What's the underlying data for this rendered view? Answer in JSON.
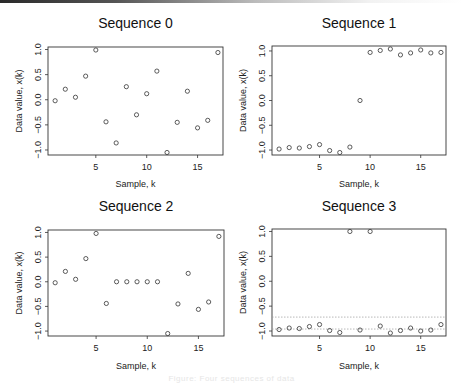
{
  "figure": {
    "caption": "Figure: Four sequences of data"
  },
  "chart_data": [
    {
      "type": "scatter",
      "title": "Sequence 0",
      "xlabel": "Sample, k",
      "ylabel": "Data value, x(k)",
      "xlim": [
        0.3,
        17.5
      ],
      "ylim": [
        -1.1,
        1.05
      ],
      "xticks": [
        5,
        10,
        15
      ],
      "yticks": [
        -1.0,
        -0.5,
        0.0,
        0.5,
        1.0
      ],
      "ytick_labels": [
        "−1.0",
        "−0.5",
        "0.0",
        "0.5",
        "1.0"
      ],
      "marker": "open-circle",
      "grid": false,
      "x": [
        1,
        2,
        3,
        4,
        5,
        6,
        7,
        8,
        9,
        10,
        11,
        12,
        13,
        14,
        15,
        16,
        17
      ],
      "y": [
        -0.02,
        0.21,
        0.05,
        0.47,
        0.99,
        -0.44,
        -0.86,
        0.26,
        -0.3,
        0.12,
        0.57,
        -1.05,
        -0.45,
        0.17,
        -0.56,
        -0.41,
        0.94
      ],
      "hlines": []
    },
    {
      "type": "scatter",
      "title": "Sequence 1",
      "xlabel": "Sample, k",
      "ylabel": "Data value, x(k)",
      "xlim": [
        0.3,
        17.5
      ],
      "ylim": [
        -1.1,
        1.1
      ],
      "xticks": [
        5,
        10,
        15
      ],
      "yticks": [
        -1.0,
        -0.5,
        0.0,
        0.5,
        1.0
      ],
      "ytick_labels": [
        "−1.0",
        "−0.5",
        "0.0",
        "0.5",
        "1.0"
      ],
      "marker": "open-circle",
      "grid": false,
      "x": [
        1,
        2,
        3,
        4,
        5,
        6,
        7,
        8,
        9,
        10,
        11,
        12,
        13,
        14,
        15,
        16,
        17
      ],
      "y": [
        -0.98,
        -0.95,
        -0.96,
        -0.93,
        -0.89,
        -1.01,
        -1.05,
        -0.94,
        0.0,
        0.97,
        1.01,
        1.04,
        0.92,
        0.96,
        1.02,
        0.96,
        0.97
      ],
      "hlines": []
    },
    {
      "type": "scatter",
      "title": "Sequence 2",
      "xlabel": "Sample, k",
      "ylabel": "Data value, x(k)",
      "xlim": [
        0.3,
        17.5
      ],
      "ylim": [
        -1.1,
        1.05
      ],
      "xticks": [
        5,
        10,
        15
      ],
      "yticks": [
        -1.0,
        -0.5,
        0.0,
        0.5,
        1.0
      ],
      "ytick_labels": [
        "−1.0",
        "−0.5",
        "0.0",
        "0.5",
        "1.0"
      ],
      "marker": "open-circle",
      "grid": false,
      "x": [
        1,
        2,
        3,
        4,
        5,
        6,
        7,
        8,
        9,
        10,
        11,
        12,
        13,
        14,
        15,
        16,
        17
      ],
      "y": [
        -0.02,
        0.21,
        0.05,
        0.47,
        0.98,
        -0.44,
        0.0,
        0.0,
        0.0,
        0.0,
        0.0,
        -1.05,
        -0.45,
        0.17,
        -0.56,
        -0.41,
        0.92
      ],
      "hlines": []
    },
    {
      "type": "scatter",
      "title": "Sequence 3",
      "xlabel": "Sample, k",
      "ylabel": "Data value, x(k)",
      "xlim": [
        0.3,
        17.5
      ],
      "ylim": [
        -1.1,
        1.05
      ],
      "xticks": [
        5,
        10,
        15
      ],
      "yticks": [
        -1.0,
        -0.5,
        0.0,
        0.5,
        1.0
      ],
      "ytick_labels": [
        "−1.0",
        "−0.5",
        "0.0",
        "0.5",
        "1.0"
      ],
      "marker": "open-circle",
      "grid": false,
      "x": [
        1,
        2,
        3,
        4,
        5,
        6,
        7,
        8,
        9,
        10,
        11,
        12,
        13,
        14,
        15,
        16,
        17
      ],
      "y": [
        -0.97,
        -0.94,
        -0.95,
        -0.91,
        -0.87,
        -0.99,
        -1.03,
        1.0,
        -0.98,
        1.0,
        -0.9,
        -1.04,
        -0.99,
        -0.94,
        -1.0,
        -0.98,
        -0.87
      ],
      "hlines": [
        -0.72,
        -0.96
      ]
    }
  ],
  "layout": {
    "panels": [
      {
        "left": 48,
        "top": 47,
        "right": 223,
        "bottom": 155,
        "title_y": 28,
        "xlabel_y": 187,
        "ylabel_x": 22
      },
      {
        "left": 272,
        "top": 46,
        "right": 446,
        "bottom": 155,
        "title_y": 28,
        "xlabel_y": 187,
        "ylabel_x": 246
      },
      {
        "left": 48,
        "top": 230,
        "right": 224,
        "bottom": 336,
        "title_y": 211,
        "xlabel_y": 369,
        "ylabel_x": 22
      },
      {
        "left": 272,
        "top": 229,
        "right": 446,
        "bottom": 336,
        "title_y": 211,
        "xlabel_y": 369,
        "ylabel_x": 246
      }
    ]
  }
}
